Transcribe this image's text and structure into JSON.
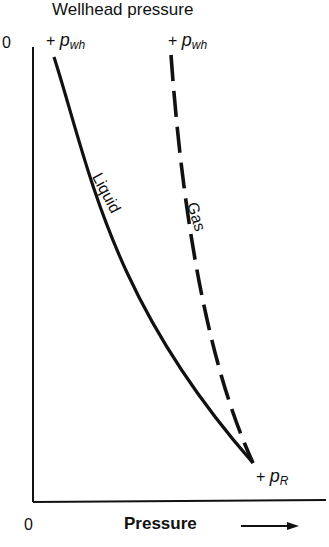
{
  "title": "Wellhead pressure",
  "y_axis_origin": "0",
  "x_axis_origin": "0",
  "x_axis_label": "Pressure",
  "x_axis_arrow": "arrow-right",
  "points": {
    "wellhead_plus": "+ ",
    "wellhead_p": "p",
    "wellhead_sub": "wh",
    "reservoir_plus": "+ ",
    "reservoir_p": "p",
    "reservoir_sub": "R"
  },
  "curves": [
    {
      "name": "Liquid",
      "style": "solid"
    },
    {
      "name": "Gas",
      "style": "dashed"
    }
  ]
}
